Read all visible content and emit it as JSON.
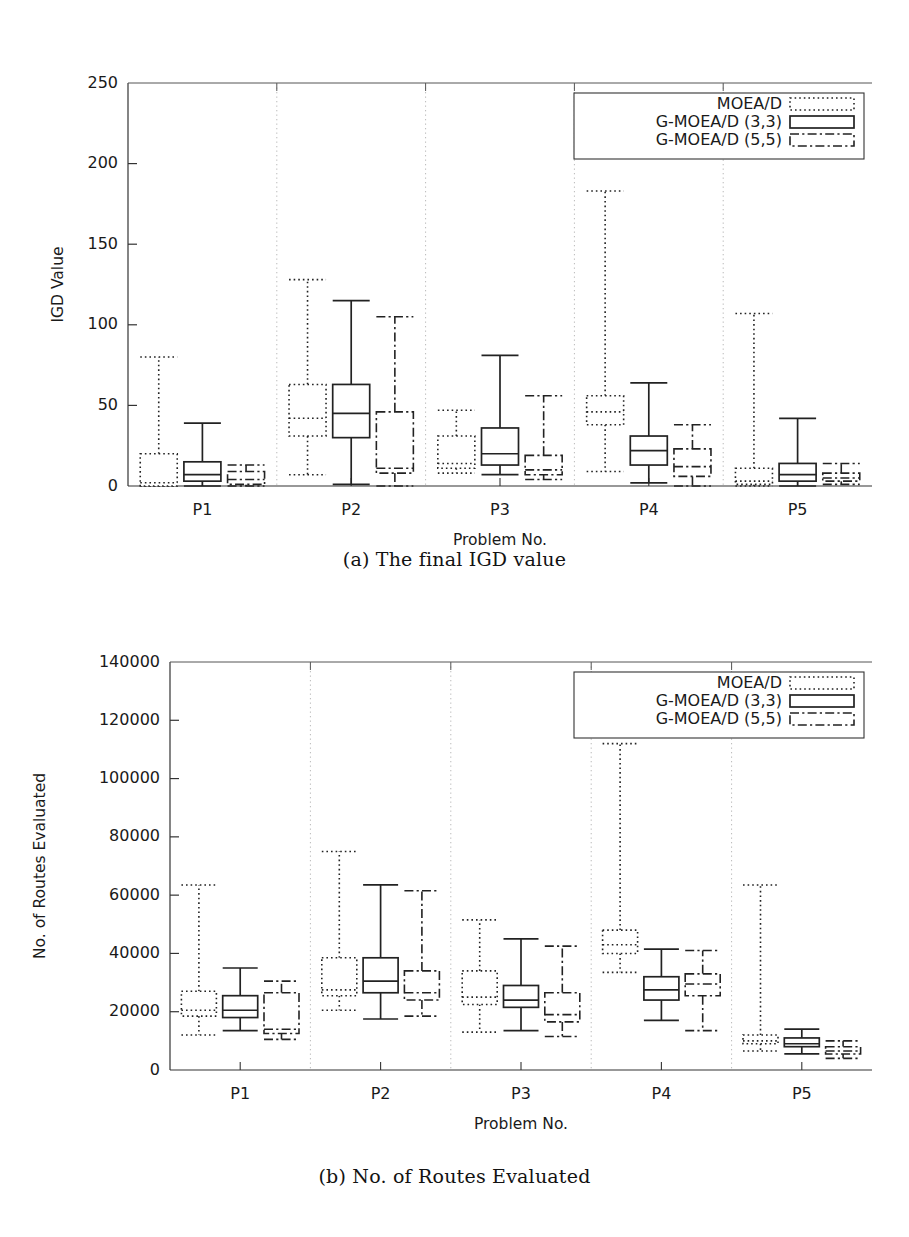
{
  "figure": {
    "panels": [
      {
        "id": "a",
        "caption": "(a) The final IGD value",
        "chart_ref": 0
      },
      {
        "id": "b",
        "caption": "(b) No. of Routes Evaluated",
        "chart_ref": 1
      }
    ]
  },
  "chart_data": [
    {
      "type": "box",
      "title": "",
      "subtitle": "",
      "xlabel": "Problem No.",
      "ylabel": "IGD Value",
      "categories": [
        "P1",
        "P2",
        "P3",
        "P4",
        "P5"
      ],
      "ylim": [
        0,
        250
      ],
      "yticks": [
        0,
        50,
        100,
        150,
        200,
        250
      ],
      "ytick_labels": [
        "0",
        "50",
        "100",
        "150",
        "200",
        "250"
      ],
      "grid": "vertical-separators-dotted",
      "legend_position": "top-right",
      "legend": [
        {
          "name": "MOEA/D",
          "style": "dotted"
        },
        {
          "name": "G-MOEA/D (3,3)",
          "style": "solid"
        },
        {
          "name": "G-MOEA/D (5,5)",
          "style": "dashdot"
        }
      ],
      "series": [
        {
          "name": "MOEA/D",
          "style": "dotted",
          "boxes": [
            {
              "category": "P1",
              "whisker_low": 0,
              "q1": 0,
              "median": 2,
              "q3": 20,
              "whisker_high": 80
            },
            {
              "category": "P2",
              "whisker_low": 7,
              "q1": 31,
              "median": 42,
              "q3": 63,
              "whisker_high": 128
            },
            {
              "category": "P3",
              "whisker_low": 8,
              "q1": 11,
              "median": 14,
              "q3": 31,
              "whisker_high": 47
            },
            {
              "category": "P4",
              "whisker_low": 9,
              "q1": 38,
              "median": 46,
              "q3": 56,
              "whisker_high": 183
            },
            {
              "category": "P5",
              "whisker_low": 0,
              "q1": 1,
              "median": 3,
              "q3": 11,
              "whisker_high": 107
            }
          ]
        },
        {
          "name": "G-MOEA/D (3,3)",
          "style": "solid",
          "boxes": [
            {
              "category": "P1",
              "whisker_low": 0,
              "q1": 3,
              "median": 7,
              "q3": 15,
              "whisker_high": 39
            },
            {
              "category": "P2",
              "whisker_low": 1,
              "q1": 30,
              "median": 45,
              "q3": 63,
              "whisker_high": 115
            },
            {
              "category": "P3",
              "whisker_low": 7,
              "q1": 13,
              "median": 20,
              "q3": 36,
              "whisker_high": 81
            },
            {
              "category": "P4",
              "whisker_low": 2,
              "q1": 13,
              "median": 22,
              "q3": 31,
              "whisker_high": 64
            },
            {
              "category": "P5",
              "whisker_low": 0,
              "q1": 3,
              "median": 7,
              "q3": 14,
              "whisker_high": 42
            }
          ]
        },
        {
          "name": "G-MOEA/D (5,5)",
          "style": "dashdot",
          "boxes": [
            {
              "category": "P1",
              "whisker_low": 0,
              "q1": 1,
              "median": 4,
              "q3": 9,
              "whisker_high": 13
            },
            {
              "category": "P2",
              "whisker_low": 0,
              "q1": 8,
              "median": 11,
              "q3": 46,
              "whisker_high": 105
            },
            {
              "category": "P3",
              "whisker_low": 4,
              "q1": 7,
              "median": 10,
              "q3": 19,
              "whisker_high": 56
            },
            {
              "category": "P4",
              "whisker_low": 0,
              "q1": 6,
              "median": 12,
              "q3": 23,
              "whisker_high": 38
            },
            {
              "category": "P5",
              "whisker_low": 1,
              "q1": 3,
              "median": 5,
              "q3": 8,
              "whisker_high": 14
            }
          ]
        }
      ]
    },
    {
      "type": "box",
      "title": "",
      "subtitle": "",
      "xlabel": "Problem No.",
      "ylabel": "No. of Routes Evaluated",
      "categories": [
        "P1",
        "P2",
        "P3",
        "P4",
        "P5"
      ],
      "ylim": [
        0,
        140000
      ],
      "yticks": [
        0,
        20000,
        40000,
        60000,
        80000,
        100000,
        120000,
        140000
      ],
      "ytick_labels": [
        "0",
        "20000",
        "40000",
        "60000",
        "80000",
        "100000",
        "120000",
        "140000"
      ],
      "grid": "vertical-separators-dotted",
      "legend_position": "top-right",
      "legend": [
        {
          "name": "MOEA/D",
          "style": "dotted"
        },
        {
          "name": "G-MOEA/D (3,3)",
          "style": "solid"
        },
        {
          "name": "G-MOEA/D (5,5)",
          "style": "dashdot"
        }
      ],
      "series": [
        {
          "name": "MOEA/D",
          "style": "dotted",
          "boxes": [
            {
              "category": "P1",
              "whisker_low": 12000,
              "q1": 18500,
              "median": 20500,
              "q3": 27000,
              "whisker_high": 63500
            },
            {
              "category": "P2",
              "whisker_low": 20500,
              "q1": 25500,
              "median": 27500,
              "q3": 38500,
              "whisker_high": 75000
            },
            {
              "category": "P3",
              "whisker_low": 13000,
              "q1": 22500,
              "median": 25000,
              "q3": 34000,
              "whisker_high": 51500
            },
            {
              "category": "P4",
              "whisker_low": 33500,
              "q1": 40000,
              "median": 43000,
              "q3": 48000,
              "whisker_high": 112000
            },
            {
              "category": "P5",
              "whisker_low": 6500,
              "q1": 9000,
              "median": 10000,
              "q3": 12000,
              "whisker_high": 63500
            }
          ]
        },
        {
          "name": "G-MOEA/D (3,3)",
          "style": "solid",
          "boxes": [
            {
              "category": "P1",
              "whisker_low": 13500,
              "q1": 18000,
              "median": 20500,
              "q3": 25500,
              "whisker_high": 35000
            },
            {
              "category": "P2",
              "whisker_low": 17500,
              "q1": 26500,
              "median": 30500,
              "q3": 38500,
              "whisker_high": 63500
            },
            {
              "category": "P3",
              "whisker_low": 13500,
              "q1": 21500,
              "median": 24000,
              "q3": 29000,
              "whisker_high": 45000
            },
            {
              "category": "P4",
              "whisker_low": 17000,
              "q1": 24000,
              "median": 27500,
              "q3": 32000,
              "whisker_high": 41500
            },
            {
              "category": "P5",
              "whisker_low": 5500,
              "q1": 8000,
              "median": 9000,
              "q3": 11000,
              "whisker_high": 14000
            }
          ]
        },
        {
          "name": "G-MOEA/D (5,5)",
          "style": "dashdot",
          "boxes": [
            {
              "category": "P1",
              "whisker_low": 10500,
              "q1": 12500,
              "median": 14000,
              "q3": 26500,
              "whisker_high": 30500
            },
            {
              "category": "P2",
              "whisker_low": 18500,
              "q1": 24000,
              "median": 26500,
              "q3": 34000,
              "whisker_high": 61500
            },
            {
              "category": "P3",
              "whisker_low": 11500,
              "q1": 16500,
              "median": 19000,
              "q3": 26500,
              "whisker_high": 42500
            },
            {
              "category": "P4",
              "whisker_low": 13500,
              "q1": 25500,
              "median": 29500,
              "q3": 33000,
              "whisker_high": 41000
            },
            {
              "category": "P5",
              "whisker_low": 4000,
              "q1": 5500,
              "median": 6500,
              "q3": 8000,
              "whisker_high": 10000
            }
          ]
        }
      ]
    }
  ]
}
